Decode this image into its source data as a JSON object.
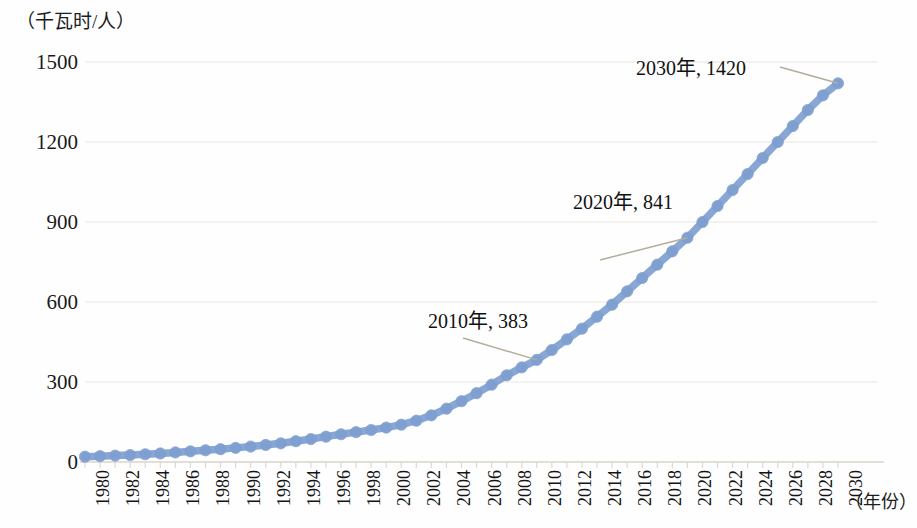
{
  "chart_data": {
    "type": "line",
    "title": "",
    "subtitle": "",
    "xlabel": "（年份）",
    "ylabel": "（千瓦时/人）",
    "xlim": [
      1980,
      2030
    ],
    "ylim": [
      0,
      1500
    ],
    "grid": true,
    "legend_position": "none",
    "series_color": "#7e9fd0",
    "marker": "circle",
    "x_tick_step": 2,
    "x_tick_labels": [
      "1980",
      "1982",
      "1984",
      "1986",
      "1988",
      "1990",
      "1992",
      "1994",
      "1996",
      "1998",
      "2000",
      "2002",
      "2004",
      "2006",
      "2008",
      "2010",
      "2012",
      "2014",
      "2016",
      "2018",
      "2020",
      "2022",
      "2024",
      "2026",
      "2028",
      "2030"
    ],
    "y_tick_labels": [
      "0",
      "300",
      "600",
      "900",
      "1200",
      "1500"
    ],
    "y_ticks": [
      0,
      300,
      600,
      900,
      1200,
      1500
    ],
    "x": [
      1980,
      1981,
      1982,
      1983,
      1984,
      1985,
      1986,
      1987,
      1988,
      1989,
      1990,
      1991,
      1992,
      1993,
      1994,
      1995,
      1996,
      1997,
      1998,
      1999,
      2000,
      2001,
      2002,
      2003,
      2004,
      2005,
      2006,
      2007,
      2008,
      2009,
      2010,
      2011,
      2012,
      2013,
      2014,
      2015,
      2016,
      2017,
      2018,
      2019,
      2020,
      2021,
      2022,
      2023,
      2024,
      2025,
      2026,
      2027,
      2028,
      2029,
      2030
    ],
    "values": [
      20,
      22,
      24,
      26,
      29,
      32,
      36,
      40,
      44,
      48,
      53,
      58,
      64,
      70,
      78,
      86,
      95,
      104,
      112,
      120,
      129,
      140,
      155,
      175,
      200,
      228,
      258,
      290,
      325,
      355,
      383,
      420,
      460,
      500,
      545,
      590,
      640,
      690,
      740,
      790,
      841,
      900,
      960,
      1020,
      1080,
      1140,
      1200,
      1260,
      1320,
      1375,
      1420
    ],
    "annotations": [
      {
        "label": "2010年, 383",
        "year": 2010,
        "value": 383
      },
      {
        "label": "2020年, 841",
        "year": 2020,
        "value": 841
      },
      {
        "label": "2030年, 1420",
        "year": 2030,
        "value": 1420
      }
    ]
  },
  "annotation_labels": {
    "a2010": "2010年, 383",
    "a2020": "2020年, 841",
    "a2030": "2030年, 1420"
  },
  "axis": {
    "y_unit": "（千瓦时/人）",
    "x_unit": "（年份）"
  }
}
